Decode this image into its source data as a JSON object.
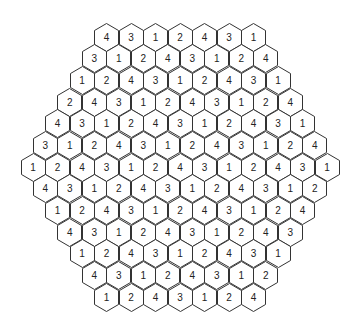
{
  "board": {
    "rows": [
      [
        4,
        3,
        1,
        2,
        4,
        3,
        1
      ],
      [
        3,
        1,
        2,
        4,
        3,
        1,
        2,
        4
      ],
      [
        1,
        2,
        4,
        3,
        1,
        2,
        4,
        3,
        1
      ],
      [
        2,
        4,
        3,
        1,
        2,
        4,
        3,
        1,
        2,
        4
      ],
      [
        4,
        3,
        1,
        2,
        4,
        3,
        1,
        2,
        4,
        3,
        1
      ],
      [
        3,
        1,
        2,
        4,
        3,
        1,
        2,
        4,
        3,
        1,
        2,
        4
      ],
      [
        1,
        2,
        4,
        3,
        1,
        2,
        4,
        3,
        1,
        2,
        4,
        3,
        1
      ],
      [
        4,
        3,
        1,
        2,
        4,
        3,
        1,
        2,
        4,
        3,
        1,
        2
      ],
      [
        1,
        2,
        4,
        3,
        1,
        2,
        4,
        3,
        1,
        2,
        4
      ],
      [
        4,
        3,
        1,
        2,
        4,
        3,
        1,
        2,
        4,
        3
      ],
      [
        1,
        2,
        4,
        3,
        1,
        2,
        4,
        3,
        1
      ],
      [
        4,
        3,
        1,
        2,
        4,
        3,
        1,
        2
      ],
      [
        1,
        2,
        4,
        3,
        1,
        2,
        4
      ]
    ]
  }
}
